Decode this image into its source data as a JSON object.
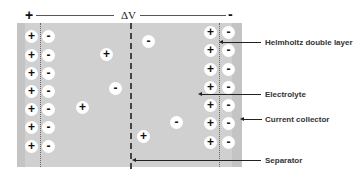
{
  "diagram": {
    "top_bar": {
      "left_sign": "+",
      "center_label": "ΔV",
      "right_sign": "-"
    },
    "labels": {
      "helmholtz": "Helmholtz double layer",
      "electrolyte": "Electrolyte",
      "current_collector": "Current collector",
      "separator": "Separator"
    },
    "ion_symbols": {
      "plus": "+",
      "minus": "-"
    },
    "colors": {
      "panel": "#d0d0d0",
      "collector": "#c4c4c4",
      "ion_fill": "#ffffff"
    }
  }
}
